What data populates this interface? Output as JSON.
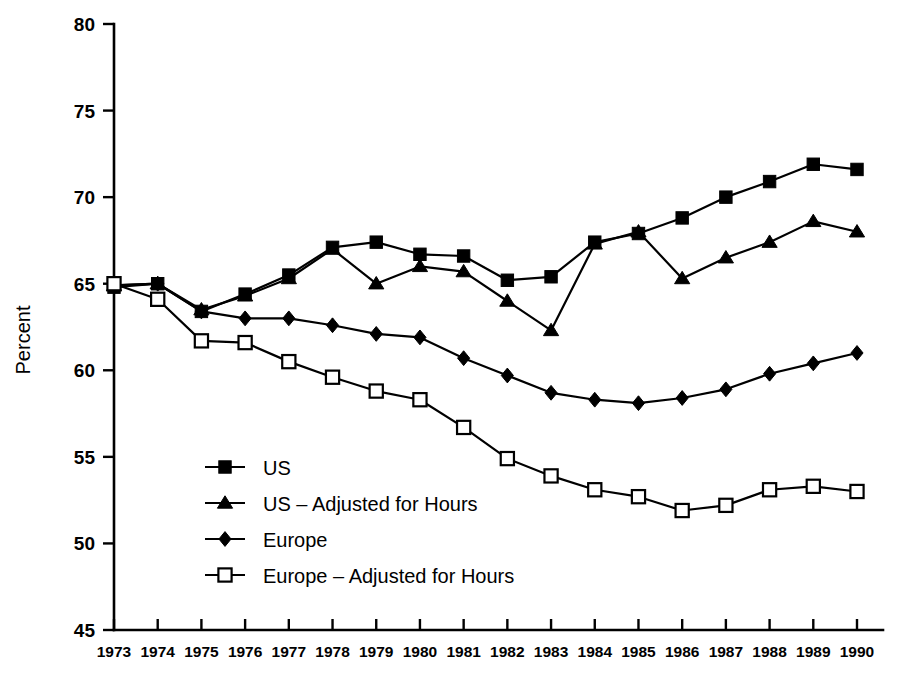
{
  "chart_data": {
    "type": "line",
    "title": "",
    "xlabel": "",
    "ylabel": "Percent",
    "ylim": [
      45,
      80
    ],
    "ytick_values": [
      45,
      50,
      55,
      60,
      65,
      70,
      75,
      80
    ],
    "ytick_labels": [
      "45",
      "50",
      "55",
      "60",
      "65",
      "70",
      "75",
      "80"
    ],
    "grid": false,
    "legend_position": "center-left",
    "x": [
      1973,
      1974,
      1975,
      1976,
      1977,
      1978,
      1979,
      1980,
      1981,
      1982,
      1983,
      1984,
      1985,
      1986,
      1987,
      1988,
      1989,
      1990
    ],
    "categories": [
      "1973",
      "1974",
      "1975",
      "1976",
      "1977",
      "1978",
      "1979",
      "1980",
      "1981",
      "1982",
      "1983",
      "1984",
      "1985",
      "1986",
      "1987",
      "1988",
      "1989",
      "1990"
    ],
    "series": [
      {
        "name": "US",
        "marker": "filled-square",
        "values": [
          64.8,
          65.0,
          63.4,
          64.4,
          65.5,
          67.1,
          67.4,
          66.7,
          66.6,
          65.2,
          65.4,
          67.4,
          67.9,
          68.8,
          70.0,
          70.9,
          71.9,
          71.6
        ]
      },
      {
        "name": "US – Adjusted for Hours",
        "marker": "filled-triangle",
        "values": [
          64.9,
          65.0,
          63.5,
          64.3,
          65.3,
          67.0,
          65.0,
          66.0,
          65.7,
          64.0,
          62.3,
          67.3,
          68.0,
          65.3,
          66.5,
          67.4,
          68.6,
          68.0
        ]
      },
      {
        "name": "Europe",
        "marker": "filled-diamond",
        "values": [
          64.9,
          65.0,
          63.4,
          63.0,
          63.0,
          62.6,
          62.1,
          61.9,
          60.7,
          59.7,
          58.7,
          58.3,
          58.1,
          58.4,
          58.9,
          59.8,
          60.4,
          61.0
        ]
      },
      {
        "name": "Europe – Adjusted for Hours",
        "marker": "open-square",
        "values": [
          65.0,
          64.1,
          61.7,
          61.6,
          60.5,
          59.6,
          58.8,
          58.3,
          56.7,
          54.9,
          53.9,
          53.1,
          52.7,
          51.9,
          52.2,
          53.1,
          53.3,
          53.0
        ]
      }
    ],
    "legend_entries": [
      {
        "label": "US",
        "marker": "filled-square"
      },
      {
        "label": "US – Adjusted for Hours",
        "marker": "filled-triangle"
      },
      {
        "label": "Europe",
        "marker": "filled-diamond"
      },
      {
        "label": "Europe – Adjusted for Hours",
        "marker": "open-square"
      }
    ],
    "colors": {
      "ink": "#000000",
      "background": "#ffffff"
    }
  }
}
